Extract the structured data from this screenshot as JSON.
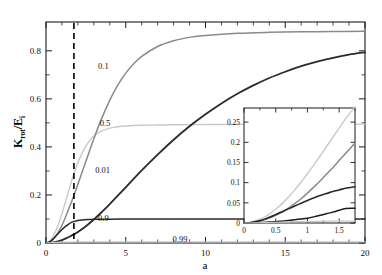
{
  "chart_data": {
    "type": "line",
    "title": "",
    "xlabel": "a",
    "ylabel": "K_rot/E_i",
    "ylabel_parts": {
      "main1": "K",
      "sub1": "rot",
      "slash": "/E",
      "sub2": "i"
    },
    "xlim": [
      0,
      20
    ],
    "ylim": [
      0,
      0.92
    ],
    "grid": false,
    "legend": "inline-curve-labels",
    "x_ticks": [
      0,
      5,
      10,
      15,
      20
    ],
    "x_tick_labels": [
      "0",
      "5",
      "10",
      "15",
      "20"
    ],
    "x_minor_ticks": [
      1,
      2,
      3,
      4,
      6,
      7,
      8,
      9,
      11,
      12,
      13,
      14,
      16,
      17,
      18,
      19
    ],
    "y_ticks": [
      0,
      0.2,
      0.4,
      0.6,
      0.8
    ],
    "y_tick_labels": [
      "0",
      "0.2",
      "0.4",
      "0.6",
      "0.8"
    ],
    "y_minor_ticks": [
      0.1,
      0.3,
      0.5,
      0.7
    ],
    "annotations": [
      {
        "text": "0.1",
        "x": 3.6,
        "y": 0.735,
        "name": "curve-label-0p1"
      },
      {
        "text": "0.5",
        "x": 3.7,
        "y": 0.5,
        "name": "curve-label-0p5"
      },
      {
        "text": "0.01",
        "x": 3.55,
        "y": 0.305,
        "name": "curve-label-0p01"
      },
      {
        "text": "0.9",
        "x": 3.6,
        "y": 0.105,
        "name": "curve-label-0p9"
      },
      {
        "text": "0.99",
        "x": 8.4,
        "y": 0.018,
        "name": "curve-label-0p99"
      }
    ],
    "vline": {
      "x": 1.75,
      "style": "dashed",
      "color": "#000000",
      "name": "critical-a-line"
    },
    "series": [
      {
        "name": "0.5",
        "color": "#c9c9c9",
        "width": 1.4,
        "x": [
          0,
          0.2,
          0.4,
          0.6,
          0.8,
          1.0,
          1.2,
          1.4,
          1.6,
          1.75,
          2.0,
          2.25,
          2.5,
          2.75,
          3.0,
          3.25,
          3.5,
          3.75,
          4.0,
          4.5,
          5.0,
          6.0,
          7.0,
          8.0,
          10.0,
          12.0,
          14.0,
          16.0,
          18.0,
          20.0
        ],
        "y": [
          0,
          0.006,
          0.022,
          0.048,
          0.082,
          0.122,
          0.166,
          0.212,
          0.258,
          0.288,
          0.334,
          0.372,
          0.403,
          0.427,
          0.445,
          0.458,
          0.467,
          0.473,
          0.478,
          0.484,
          0.487,
          0.49,
          0.491,
          0.492,
          0.493,
          0.494,
          0.494,
          0.494,
          0.495,
          0.495
        ]
      },
      {
        "name": "0.1",
        "color": "#8a8a8a",
        "width": 1.5,
        "x": [
          0,
          0.2,
          0.4,
          0.6,
          0.8,
          1.0,
          1.2,
          1.4,
          1.6,
          1.75,
          2.0,
          2.5,
          3.0,
          3.5,
          4.0,
          4.5,
          5.0,
          5.5,
          6.0,
          7.0,
          8.0,
          9.0,
          10.0,
          12.0,
          14.0,
          16.0,
          18.0,
          20.0
        ],
        "y": [
          0,
          0.003,
          0.012,
          0.027,
          0.048,
          0.074,
          0.104,
          0.137,
          0.172,
          0.198,
          0.245,
          0.34,
          0.434,
          0.52,
          0.595,
          0.657,
          0.707,
          0.746,
          0.777,
          0.818,
          0.842,
          0.856,
          0.864,
          0.873,
          0.877,
          0.879,
          0.88,
          0.881
        ]
      },
      {
        "name": "0.01",
        "color": "#2a2a2a",
        "width": 1.8,
        "x": [
          0,
          0.25,
          0.5,
          0.75,
          1.0,
          1.25,
          1.5,
          1.75,
          2.0,
          2.5,
          3.0,
          3.5,
          4.0,
          5.0,
          6.0,
          7.0,
          8.0,
          9.0,
          10.0,
          11.0,
          12.0,
          13.0,
          14.0,
          15.0,
          16.0,
          17.0,
          18.0,
          19.0,
          20.0
        ],
        "y": [
          0,
          0.0008,
          0.003,
          0.007,
          0.012,
          0.019,
          0.027,
          0.036,
          0.046,
          0.07,
          0.098,
          0.129,
          0.162,
          0.232,
          0.302,
          0.368,
          0.43,
          0.486,
          0.536,
          0.581,
          0.621,
          0.656,
          0.687,
          0.713,
          0.736,
          0.755,
          0.771,
          0.784,
          0.794
        ]
      },
      {
        "name": "0.9",
        "color": "#2a2a2a",
        "width": 1.5,
        "x": [
          0,
          0.2,
          0.4,
          0.6,
          0.8,
          1.0,
          1.2,
          1.4,
          1.6,
          1.75,
          2.0,
          2.25,
          2.5,
          2.75,
          3.0,
          3.5,
          4.0,
          5.0,
          6.0,
          8.0,
          10.0,
          14.0,
          17.0,
          20.0
        ],
        "y": [
          0,
          0.004,
          0.014,
          0.028,
          0.042,
          0.056,
          0.068,
          0.078,
          0.086,
          0.09,
          0.094,
          0.096,
          0.097,
          0.098,
          0.0985,
          0.099,
          0.0993,
          0.0996,
          0.0997,
          0.0998,
          0.0999,
          0.0999,
          0.1,
          0.1
        ]
      },
      {
        "name": "0.99",
        "color": "#c9c9c9",
        "width": 1.2,
        "x": [
          0,
          1,
          2,
          3,
          5,
          8,
          12,
          16,
          20
        ],
        "y": [
          0,
          0.0035,
          0.0048,
          0.005,
          0.005,
          0.005,
          0.005,
          0.005,
          0.005
        ]
      }
    ],
    "inset": {
      "xlim": [
        0,
        1.75
      ],
      "ylim": [
        0,
        0.285
      ],
      "xlabel": "",
      "ylabel": "",
      "x_ticks": [
        0,
        0.5,
        1,
        1.5
      ],
      "x_tick_labels": [
        "0",
        "0.5",
        "1",
        "1.5"
      ],
      "x_minor_ticks": [
        0.25,
        0.75,
        1.25,
        1.75
      ],
      "y_ticks": [
        0,
        0.05,
        0.1,
        0.15,
        0.2,
        0.25
      ],
      "y_tick_labels": [
        "0",
        "0.05",
        "0.1",
        "0.15",
        "0.2",
        "0.25"
      ],
      "series": [
        {
          "name": "0.5",
          "color": "#c9c9c9",
          "width": 1.4,
          "x": [
            0,
            0.1,
            0.2,
            0.3,
            0.4,
            0.5,
            0.6,
            0.7,
            0.8,
            0.9,
            1.0,
            1.1,
            1.2,
            1.3,
            1.4,
            1.5,
            1.6,
            1.75
          ],
          "y": [
            0,
            0.0015,
            0.006,
            0.013,
            0.022,
            0.034,
            0.048,
            0.064,
            0.082,
            0.101,
            0.122,
            0.144,
            0.166,
            0.189,
            0.212,
            0.235,
            0.258,
            0.288
          ]
        },
        {
          "name": "0.1",
          "color": "#8a8a8a",
          "width": 1.5,
          "x": [
            0,
            0.1,
            0.2,
            0.3,
            0.4,
            0.5,
            0.6,
            0.7,
            0.8,
            0.9,
            1.0,
            1.1,
            1.2,
            1.3,
            1.4,
            1.5,
            1.6,
            1.75
          ],
          "y": [
            0,
            0.0008,
            0.003,
            0.007,
            0.012,
            0.019,
            0.027,
            0.037,
            0.048,
            0.06,
            0.074,
            0.089,
            0.104,
            0.121,
            0.137,
            0.155,
            0.172,
            0.198
          ]
        },
        {
          "name": "0.9",
          "color": "#2a2a2a",
          "width": 1.6,
          "x": [
            0,
            0.1,
            0.2,
            0.3,
            0.4,
            0.5,
            0.6,
            0.7,
            0.8,
            0.9,
            1.0,
            1.1,
            1.2,
            1.3,
            1.4,
            1.5,
            1.6,
            1.75
          ],
          "y": [
            0,
            0.001,
            0.004,
            0.008,
            0.014,
            0.021,
            0.028,
            0.035,
            0.042,
            0.049,
            0.056,
            0.062,
            0.068,
            0.073,
            0.078,
            0.082,
            0.086,
            0.09
          ]
        },
        {
          "name": "0.01",
          "color": "#1a1a1a",
          "width": 1.5,
          "x": [
            0,
            0.1,
            0.2,
            0.3,
            0.4,
            0.5,
            0.6,
            0.7,
            0.8,
            0.9,
            1.0,
            1.1,
            1.2,
            1.3,
            1.4,
            1.5,
            1.6,
            1.75
          ],
          "y": [
            0,
            0.0002,
            0.0006,
            0.0013,
            0.0022,
            0.003,
            0.0045,
            0.006,
            0.008,
            0.01,
            0.012,
            0.0152,
            0.019,
            0.023,
            0.027,
            0.0315,
            0.036,
            0.0365
          ]
        },
        {
          "name": "0.99",
          "color": "#c9c9c9",
          "width": 1.2,
          "x": [
            0,
            0.3,
            0.6,
            1.0,
            1.4,
            1.75
          ],
          "y": [
            0,
            0.0008,
            0.0022,
            0.0036,
            0.0044,
            0.0048
          ]
        }
      ]
    }
  }
}
